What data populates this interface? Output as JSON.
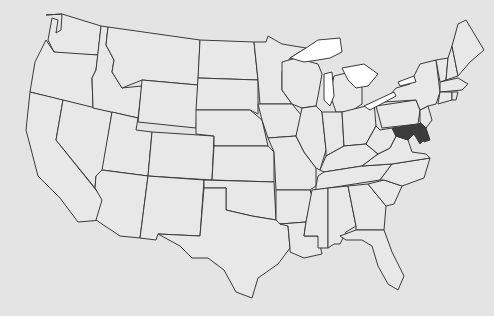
{
  "map": {
    "title": "United States map",
    "background": "#e4e4e4",
    "state_fill": "#e8e8e8",
    "highlight_fill": "#3c3c3c",
    "lake_fill": "#ffffff",
    "highlighted_states": [
      "Maryland",
      "Delaware"
    ]
  }
}
